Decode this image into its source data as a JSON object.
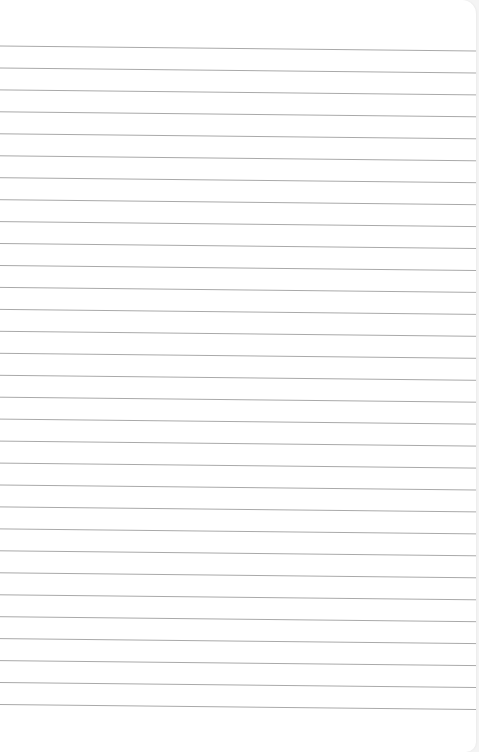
{
  "image": {
    "subject": "blank lined notebook paper",
    "paper_color": "#ffffff",
    "background_color": "#f4f4f4",
    "line_color": "#a9a9a9",
    "line_count": 31,
    "first_line_y_left": 46,
    "line_spacing": 21.95,
    "line_slope_px": 5
  }
}
